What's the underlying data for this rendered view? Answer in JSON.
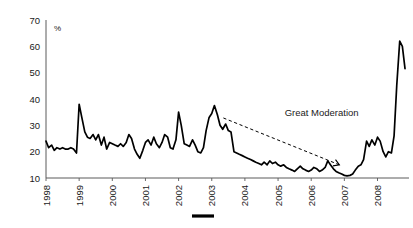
{
  "chart_data": {
    "type": "line",
    "title": "",
    "subtitle": "",
    "xlabel": "",
    "ylabel": "%",
    "unit_label": "%",
    "grid": false,
    "legend_position": "bottom",
    "legend_entries": [
      {
        "label": "",
        "color": "#000000",
        "style": "solid-line"
      }
    ],
    "xlim": [
      1998.0,
      2008.95
    ],
    "ylim": [
      10,
      70
    ],
    "ytick_labels": [
      "70",
      "60",
      "50",
      "40",
      "30",
      "20",
      "10"
    ],
    "ytick_values": [
      70,
      60,
      50,
      40,
      30,
      20,
      10
    ],
    "xtick_labels": [
      "1998",
      "1999",
      "2000",
      "2001",
      "2002",
      "2003",
      "2004",
      "2005",
      "2006",
      "2007",
      "2008"
    ],
    "xtick_values": [
      1998,
      1999,
      2000,
      2001,
      2002,
      2003,
      2004,
      2005,
      2006,
      2007,
      2008
    ],
    "annotations": [
      {
        "text": "Great Moderation",
        "x": 2005.2,
        "y": 33.5,
        "arrow_from": [
          2003.35,
          32.8
        ],
        "arrow_to": [
          2006.85,
          15.0
        ],
        "style": "dashed-arrow"
      }
    ],
    "series": [
      {
        "name": "",
        "color": "#000000",
        "x": [
          1998.0,
          1998.08,
          1998.17,
          1998.25,
          1998.33,
          1998.42,
          1998.5,
          1998.58,
          1998.67,
          1998.75,
          1998.83,
          1998.92,
          1999.0,
          1999.08,
          1999.17,
          1999.25,
          1999.33,
          1999.42,
          1999.5,
          1999.58,
          1999.67,
          1999.75,
          1999.83,
          1999.92,
          2000.0,
          2000.08,
          2000.17,
          2000.25,
          2000.33,
          2000.42,
          2000.5,
          2000.58,
          2000.67,
          2000.75,
          2000.83,
          2000.92,
          2001.0,
          2001.08,
          2001.17,
          2001.25,
          2001.33,
          2001.42,
          2001.5,
          2001.58,
          2001.67,
          2001.75,
          2001.83,
          2001.92,
          2002.0,
          2002.08,
          2002.17,
          2002.25,
          2002.33,
          2002.42,
          2002.5,
          2002.58,
          2002.67,
          2002.75,
          2002.83,
          2002.92,
          2003.0,
          2003.08,
          2003.17,
          2003.25,
          2003.33,
          2003.42,
          2003.5,
          2003.58,
          2003.67,
          2003.75,
          2003.83,
          2003.92,
          2004.0,
          2004.08,
          2004.17,
          2004.25,
          2004.33,
          2004.42,
          2004.5,
          2004.58,
          2004.67,
          2004.75,
          2004.83,
          2004.92,
          2005.0,
          2005.08,
          2005.17,
          2005.25,
          2005.33,
          2005.42,
          2005.5,
          2005.58,
          2005.67,
          2005.75,
          2005.83,
          2005.92,
          2006.0,
          2006.08,
          2006.17,
          2006.25,
          2006.33,
          2006.42,
          2006.5,
          2006.58,
          2006.67,
          2006.75,
          2006.83,
          2006.92,
          2007.0,
          2007.08,
          2007.17,
          2007.25,
          2007.33,
          2007.42,
          2007.5,
          2007.58,
          2007.67,
          2007.75,
          2007.83,
          2007.92,
          2008.0,
          2008.08,
          2008.17,
          2008.25,
          2008.33,
          2008.42,
          2008.5,
          2008.58,
          2008.67,
          2008.75,
          2008.83
        ],
        "y": [
          24.0,
          21.5,
          22.5,
          20.5,
          21.5,
          21.0,
          21.5,
          21.0,
          21.0,
          21.5,
          21.0,
          19.5,
          38.0,
          33.0,
          27.5,
          25.5,
          25.0,
          26.5,
          24.5,
          26.5,
          22.5,
          25.5,
          21.0,
          23.5,
          23.0,
          22.5,
          22.0,
          23.0,
          22.0,
          23.5,
          26.5,
          25.0,
          21.0,
          19.0,
          17.5,
          20.5,
          23.5,
          24.5,
          22.5,
          25.5,
          23.0,
          21.5,
          23.5,
          26.5,
          25.5,
          21.5,
          21.0,
          24.5,
          35.0,
          30.0,
          23.0,
          22.5,
          22.0,
          24.5,
          22.5,
          20.0,
          19.5,
          21.5,
          28.0,
          33.0,
          34.5,
          37.5,
          34.0,
          30.0,
          28.5,
          30.5,
          28.0,
          27.5,
          20.0,
          19.5,
          19.0,
          18.5,
          18.0,
          17.5,
          17.0,
          16.5,
          16.0,
          15.5,
          15.0,
          16.0,
          15.0,
          16.5,
          15.5,
          16.0,
          15.0,
          14.5,
          15.0,
          14.0,
          13.5,
          13.0,
          12.5,
          13.5,
          14.5,
          13.5,
          13.0,
          12.5,
          13.0,
          14.0,
          13.5,
          12.5,
          13.0,
          14.0,
          16.5,
          15.0,
          13.5,
          12.5,
          12.0,
          11.5,
          11.0,
          10.8,
          11.0,
          11.5,
          13.0,
          14.5,
          15.0,
          17.0,
          24.0,
          22.0,
          24.5,
          22.5,
          25.5,
          24.0,
          20.0,
          18.0,
          20.0,
          19.5,
          26.0,
          45.0,
          62.0,
          60.0,
          51.5
        ]
      }
    ]
  },
  "axis": {
    "unit_label": "%"
  },
  "legend": {
    "marker_label": ""
  }
}
